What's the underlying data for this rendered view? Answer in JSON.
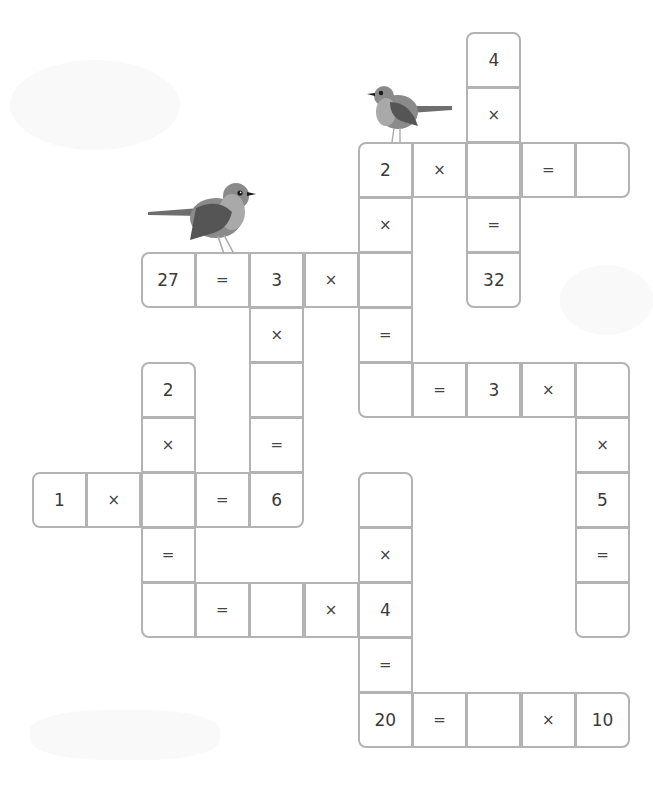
{
  "puzzle": {
    "type": "multiplication-crossword",
    "grid_origin": {
      "x": 32,
      "y": 32
    },
    "cell_size": {
      "w": 54.3,
      "h": 55
    },
    "colors": {
      "border": "#b3b3b3",
      "text": "#3a3a3a",
      "background": "#ffffff"
    },
    "cells": [
      {
        "c": 8,
        "r": 0,
        "v": "4",
        "kind": "number",
        "corners": "tl tr"
      },
      {
        "c": 8,
        "r": 1,
        "v": "×",
        "kind": "op"
      },
      {
        "c": 6,
        "r": 2,
        "v": "2",
        "kind": "number",
        "corners": "tl"
      },
      {
        "c": 7,
        "r": 2,
        "v": "×",
        "kind": "op"
      },
      {
        "c": 8,
        "r": 2,
        "v": "",
        "kind": "blank"
      },
      {
        "c": 9,
        "r": 2,
        "v": "=",
        "kind": "op"
      },
      {
        "c": 10,
        "r": 2,
        "v": "",
        "kind": "blank",
        "corners": "tr br"
      },
      {
        "c": 6,
        "r": 3,
        "v": "×",
        "kind": "op"
      },
      {
        "c": 8,
        "r": 3,
        "v": "=",
        "kind": "op"
      },
      {
        "c": 2,
        "r": 4,
        "v": "27",
        "kind": "number",
        "corners": "tl bl"
      },
      {
        "c": 3,
        "r": 4,
        "v": "=",
        "kind": "op"
      },
      {
        "c": 4,
        "r": 4,
        "v": "3",
        "kind": "number"
      },
      {
        "c": 5,
        "r": 4,
        "v": "×",
        "kind": "op"
      },
      {
        "c": 6,
        "r": 4,
        "v": "",
        "kind": "blank"
      },
      {
        "c": 8,
        "r": 4,
        "v": "32",
        "kind": "number",
        "corners": "bl br"
      },
      {
        "c": 4,
        "r": 5,
        "v": "×",
        "kind": "op"
      },
      {
        "c": 6,
        "r": 5,
        "v": "=",
        "kind": "op"
      },
      {
        "c": 2,
        "r": 6,
        "v": "2",
        "kind": "number",
        "corners": "tl tr"
      },
      {
        "c": 4,
        "r": 6,
        "v": "",
        "kind": "blank"
      },
      {
        "c": 6,
        "r": 6,
        "v": "",
        "kind": "blank",
        "corners": "bl"
      },
      {
        "c": 7,
        "r": 6,
        "v": "=",
        "kind": "op"
      },
      {
        "c": 8,
        "r": 6,
        "v": "3",
        "kind": "number"
      },
      {
        "c": 9,
        "r": 6,
        "v": "×",
        "kind": "op"
      },
      {
        "c": 10,
        "r": 6,
        "v": "",
        "kind": "blank",
        "corners": "tr"
      },
      {
        "c": 2,
        "r": 7,
        "v": "×",
        "kind": "op"
      },
      {
        "c": 4,
        "r": 7,
        "v": "=",
        "kind": "op"
      },
      {
        "c": 10,
        "r": 7,
        "v": "×",
        "kind": "op"
      },
      {
        "c": 0,
        "r": 8,
        "v": "1",
        "kind": "number",
        "corners": "tl bl"
      },
      {
        "c": 1,
        "r": 8,
        "v": "×",
        "kind": "op"
      },
      {
        "c": 2,
        "r": 8,
        "v": "",
        "kind": "blank"
      },
      {
        "c": 3,
        "r": 8,
        "v": "=",
        "kind": "op"
      },
      {
        "c": 4,
        "r": 8,
        "v": "6",
        "kind": "number",
        "corners": "br"
      },
      {
        "c": 6,
        "r": 8,
        "v": "",
        "kind": "blank",
        "corners": "tl tr"
      },
      {
        "c": 10,
        "r": 8,
        "v": "5",
        "kind": "number"
      },
      {
        "c": 2,
        "r": 9,
        "v": "=",
        "kind": "op"
      },
      {
        "c": 6,
        "r": 9,
        "v": "×",
        "kind": "op"
      },
      {
        "c": 10,
        "r": 9,
        "v": "=",
        "kind": "op"
      },
      {
        "c": 2,
        "r": 10,
        "v": "",
        "kind": "blank",
        "corners": "bl"
      },
      {
        "c": 3,
        "r": 10,
        "v": "=",
        "kind": "op"
      },
      {
        "c": 4,
        "r": 10,
        "v": "",
        "kind": "blank"
      },
      {
        "c": 5,
        "r": 10,
        "v": "×",
        "kind": "op"
      },
      {
        "c": 6,
        "r": 10,
        "v": "4",
        "kind": "number"
      },
      {
        "c": 10,
        "r": 10,
        "v": "",
        "kind": "blank",
        "corners": "bl br"
      },
      {
        "c": 6,
        "r": 11,
        "v": "=",
        "kind": "op"
      },
      {
        "c": 6,
        "r": 12,
        "v": "20",
        "kind": "number",
        "corners": "bl"
      },
      {
        "c": 7,
        "r": 12,
        "v": "=",
        "kind": "op"
      },
      {
        "c": 8,
        "r": 12,
        "v": "",
        "kind": "blank"
      },
      {
        "c": 9,
        "r": 12,
        "v": "×",
        "kind": "op"
      },
      {
        "c": 10,
        "r": 12,
        "v": "10",
        "kind": "number",
        "corners": "tr br"
      }
    ]
  },
  "decorations": {
    "birds": [
      {
        "name": "robin-large",
        "x": 148,
        "y": 178,
        "w": 112,
        "h": 78,
        "facing": "right"
      },
      {
        "name": "robin-small",
        "x": 366,
        "y": 82,
        "w": 86,
        "h": 62,
        "facing": "left"
      }
    ],
    "colors": {
      "body": "#8a8a8a",
      "wing": "#555555",
      "breast": "#a9a9a9",
      "tail": "#6e6e6e",
      "eye": "#1a1a1a"
    }
  }
}
